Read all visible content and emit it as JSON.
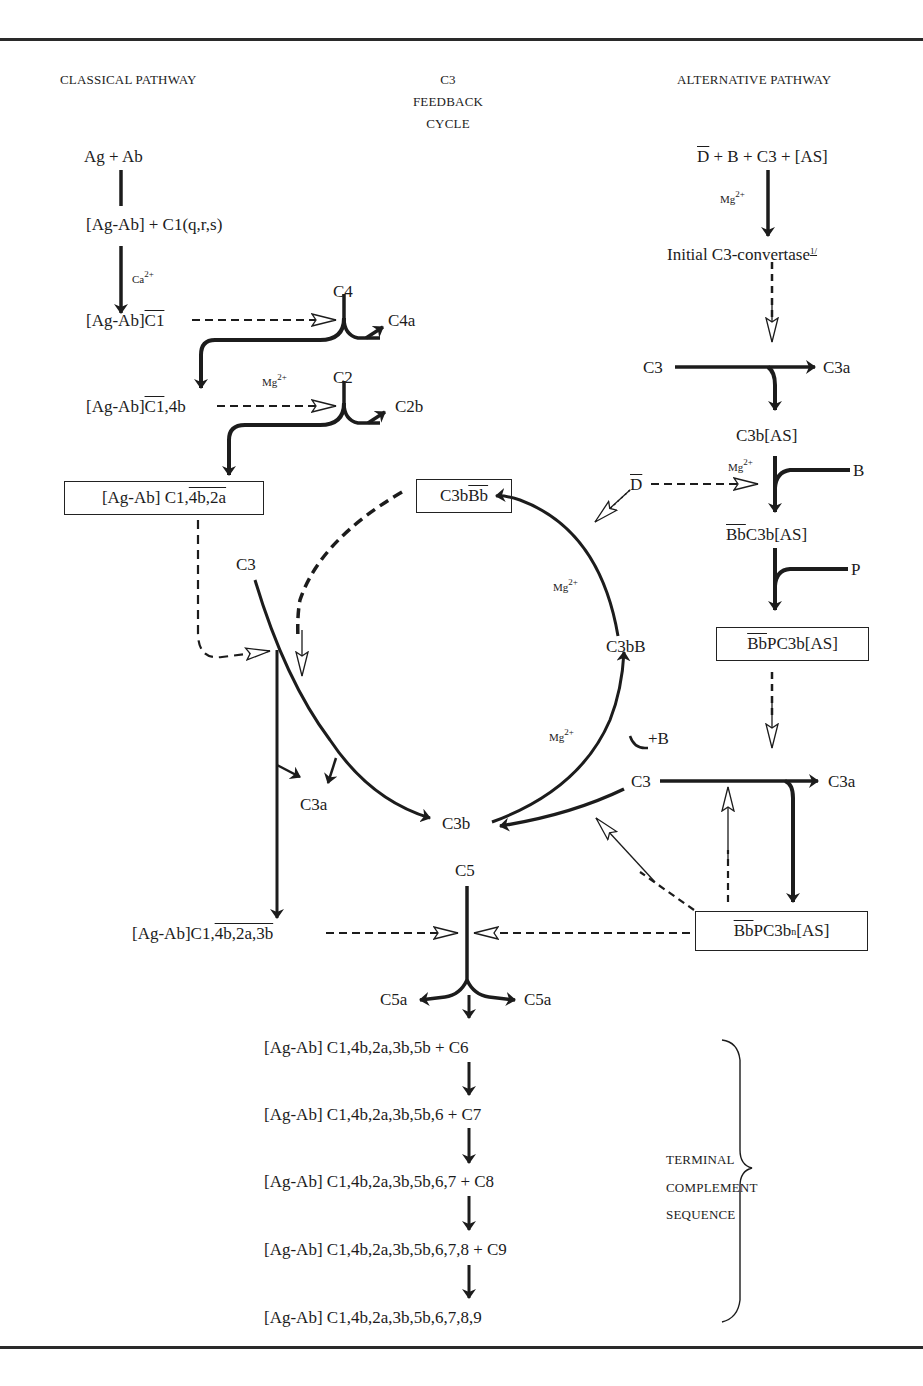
{
  "headers": {
    "classical": "CLASSICAL PATHWAY",
    "feedback_line1": "C3",
    "feedback_line2": "FEEDBACK",
    "feedback_line3": "CYCLE",
    "alternative": "ALTERNATIVE PATHWAY"
  },
  "classical": {
    "start": "Ag + Ab",
    "complex1": "[Ag-Ab] + C1(q,r,s)",
    "ion1": "Ca",
    "ion1_charge": "2+",
    "activated_prefix": "[Ag-Ab]",
    "activated_c1": "C1",
    "c4": "C4",
    "c4a": "C4a",
    "complex2_prefix": "[Ag-Ab]",
    "complex2_c1": "C1",
    "complex2_suffix": ",4b",
    "ion2": "Mg",
    "ion2_charge": "2+",
    "c2": "C2",
    "c2b": "C2b",
    "convertase_prefix": "[Ag-Ab] C1,",
    "convertase_overline": "4b,2a",
    "c3_input": "C3",
    "c3a": "C3a",
    "c5_convertase_prefix": "[Ag-Ab]C1,",
    "c5_convertase_overline": "4b,2a,3b"
  },
  "feedback_cycle": {
    "box_prefix": "C3b",
    "box_overline": "Bb",
    "ion_top": "Mg",
    "ion_top_charge": "2+",
    "c3bB": "C3bB",
    "ion_bottom": "Mg",
    "ion_bottom_charge": "2+",
    "plus_b": "+B",
    "c3b": "C3b"
  },
  "alternative": {
    "start_d": "D",
    "start_rest": " + B + C3 + [AS]",
    "ion1": "Mg",
    "ion1_charge": "2+",
    "initial": "Initial C3-convertase",
    "footnote": "1/",
    "c3": "C3",
    "c3a": "C3a",
    "c3b_as": "C3b[AS]",
    "ion2": "Mg",
    "ion2_charge": "2+",
    "d_factor": "D",
    "b_factor": "B",
    "bb_c3b_bb": "Bb",
    "bb_c3b_rest": "C3b[AS]",
    "p_factor": "P",
    "stable_bb": "Bb",
    "stable_rest": "PC3b[AS]",
    "amp_c3": "C3",
    "amp_c3a": "C3a",
    "c5conv_bb": "Bb",
    "c5conv_mid": "PC3b",
    "c5conv_sub": "n",
    "c5conv_end": "[AS]"
  },
  "terminal": {
    "c5": "C5",
    "c5a_left": "C5a",
    "c5a_right": "C5a",
    "steps": [
      "[Ag-Ab] C1,4b,2a,3b,5b + C6",
      "[Ag-Ab] C1,4b,2a,3b,5b,6 + C7",
      "[Ag-Ab] C1,4b,2a,3b,5b,6,7 + C8",
      "[Ag-Ab] C1,4b,2a,3b,5b,6,7,8 + C9",
      "[Ag-Ab] C1,4b,2a,3b,5b,6,7,8,9"
    ],
    "brace_label_line1": "TERMINAL",
    "brace_label_line2": "COMPLEMENT",
    "brace_label_line3": "SEQUENCE"
  },
  "colors": {
    "ink": "#1c1c1c",
    "paper": "#ffffff"
  }
}
